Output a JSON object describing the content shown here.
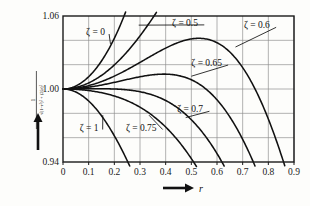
{
  "figure": {
    "background_color": "#fdfdfb",
    "line_color": "#111111",
    "grid_color": "#8a8a8a",
    "frame_color": "#1a1a1a"
  },
  "axes": {
    "x_label": "r",
    "x_arrow_glyph": "arrow-right-icon",
    "y_label_numerator": "1",
    "y_label_denominator": "√(1−r²)² + (2ζr)²",
    "y_arrow_glyph": "arrow-up-icon",
    "x_ticks": [
      "0",
      "0.1",
      "0.2",
      "0.3",
      "0.4",
      "0.5",
      "0.6",
      "0.7",
      "0.8",
      "0.9"
    ],
    "y_ticks": [
      "0.94",
      "1.00",
      "1.06"
    ]
  },
  "chart_data": {
    "type": "line",
    "title": "",
    "xlabel": "r",
    "ylabel": "1/√((1−r²)² + (2ζr)²)",
    "xlim": [
      0,
      0.9
    ],
    "ylim": [
      0.94,
      1.06
    ],
    "grid": true,
    "legend_position": "inline-annotations",
    "x_tick_values": [
      0,
      0.1,
      0.2,
      0.3,
      0.4,
      0.5,
      0.6,
      0.7,
      0.8,
      0.9
    ],
    "y_tick_values": [
      0.94,
      1.0,
      1.06
    ],
    "formula": "1/sqrt((1-r^2)^2 + (2*zeta*r)^2)",
    "series": [
      {
        "name": "ζ = 0",
        "zeta": 0,
        "label": "ζ = 0",
        "x": [
          0,
          0.05,
          0.1,
          0.15,
          0.2,
          0.25,
          0.3,
          0.32
        ],
        "values": [
          1.0,
          1.0025,
          1.0101,
          1.023,
          1.0417,
          1.0667,
          1.0989,
          1.1136
        ]
      },
      {
        "name": "ζ = 0.5",
        "zeta": 0.5,
        "label": "ζ = 0.5",
        "x": [
          0,
          0.1,
          0.2,
          0.3,
          0.4,
          0.5,
          0.6,
          0.65,
          0.7
        ],
        "values": [
          1.0,
          1.0051,
          1.0203,
          1.0445,
          1.0747,
          1.1094,
          1.1418,
          1.1531,
          1.1589
        ]
      },
      {
        "name": "ζ = 0.6",
        "zeta": 0.6,
        "label": "ζ = 0.6",
        "x": [
          0,
          0.1,
          0.2,
          0.3,
          0.4,
          0.5,
          0.53,
          0.6,
          0.7,
          0.8,
          0.85
        ],
        "values": [
          1.0,
          1.0027,
          1.0104,
          1.0212,
          1.0323,
          1.0404,
          1.0414,
          1.0398,
          1.0252,
          0.9948,
          0.9728
        ]
      },
      {
        "name": "ζ = 0.65",
        "zeta": 0.65,
        "label": "ζ = 0.65",
        "x": [
          0,
          0.1,
          0.2,
          0.3,
          0.4,
          0.45,
          0.5,
          0.6,
          0.7,
          0.75
        ],
        "values": [
          1.0,
          1.0013,
          1.0049,
          1.0095,
          1.0128,
          1.0128,
          1.0112,
          1.0017,
          0.9829,
          0.9696
        ]
      },
      {
        "name": "ζ = 0.7",
        "zeta": 0.7,
        "label": "ζ = 0.7",
        "x": [
          0,
          0.1,
          0.2,
          0.3,
          0.4,
          0.5,
          0.6,
          0.65,
          0.7
        ],
        "values": [
          1.0,
          1.0,
          0.9998,
          0.999,
          0.9963,
          0.9898,
          0.9776,
          0.9688,
          0.9583
        ]
      },
      {
        "name": "ζ = 0.75",
        "zeta": 0.75,
        "label": "ζ = 0.75",
        "x": [
          0,
          0.1,
          0.2,
          0.3,
          0.4,
          0.45,
          0.5,
          0.55
        ],
        "values": [
          1.0,
          0.9988,
          0.9952,
          0.9894,
          0.9811,
          0.9759,
          0.9699,
          0.963
        ]
      },
      {
        "name": "ζ = 1",
        "zeta": 1,
        "label": "ζ = 1",
        "x": [
          0,
          0.05,
          0.1,
          0.15,
          0.2,
          0.25,
          0.3
        ],
        "values": [
          1.0,
          0.9975,
          0.9901,
          0.9781,
          0.9619,
          0.9423,
          0.9202
        ]
      }
    ],
    "annotations": [
      {
        "text": "ζ = 0",
        "x": 0.09,
        "y": 1.047,
        "leader_to_x": 0.185,
        "leader_to_y": 1.037
      },
      {
        "text": "ζ = 0.5",
        "x": 0.425,
        "y": 1.0545,
        "leader_to_x": 0.295,
        "leader_to_y": 1.0525
      },
      {
        "text": "ζ = 0.6",
        "x": 0.705,
        "y": 1.0525,
        "leader_to_x": 0.672,
        "leader_to_y": 1.0345
      },
      {
        "text": "ζ = 0.65",
        "x": 0.5,
        "y": 1.0215,
        "leader_to_x": 0.5,
        "leader_to_y": 1.0105
      },
      {
        "text": "ζ = 0.7",
        "x": 0.445,
        "y": 0.9835,
        "leader_to_x": 0.478,
        "leader_to_y": 0.9765
      },
      {
        "text": "ζ = 0.75",
        "x": 0.245,
        "y": 0.9685,
        "leader_to_x": 0.335,
        "leader_to_y": 0.9785
      },
      {
        "text": "ζ = 1",
        "x": 0.065,
        "y": 0.9685,
        "leader_to_x": 0.155,
        "leader_to_y": 0.9785
      }
    ]
  }
}
